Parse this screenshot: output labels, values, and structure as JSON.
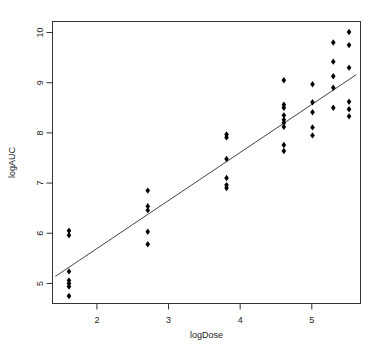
{
  "chart_data": {
    "type": "scatter",
    "title": "",
    "xlabel": "logDose",
    "ylabel": "logAUC",
    "xlim": [
      1.38,
      5.68
    ],
    "ylim": [
      4.6,
      10.22
    ],
    "xticks": [
      2,
      3,
      4,
      5
    ],
    "xtick_labels": [
      "2",
      "3",
      "4",
      "5"
    ],
    "yticks": [
      5,
      6,
      7,
      8,
      9,
      10
    ],
    "ytick_labels": [
      "5",
      "6",
      "7",
      "8",
      "9",
      "10"
    ],
    "grid": false,
    "legend": "none",
    "point_color": "#000000",
    "point_symbol": "filled-diamond",
    "line_color": "#444444",
    "frame": true,
    "points": [
      {
        "x": 1.61,
        "y": 6.05
      },
      {
        "x": 1.61,
        "y": 5.96
      },
      {
        "x": 1.61,
        "y": 5.24
      },
      {
        "x": 1.61,
        "y": 5.06
      },
      {
        "x": 1.61,
        "y": 5.0
      },
      {
        "x": 1.61,
        "y": 4.94
      },
      {
        "x": 1.61,
        "y": 4.75
      },
      {
        "x": 2.71,
        "y": 6.85
      },
      {
        "x": 2.71,
        "y": 6.54
      },
      {
        "x": 2.71,
        "y": 6.46
      },
      {
        "x": 2.71,
        "y": 6.03
      },
      {
        "x": 2.71,
        "y": 5.78
      },
      {
        "x": 3.81,
        "y": 7.97
      },
      {
        "x": 3.81,
        "y": 7.91
      },
      {
        "x": 3.81,
        "y": 7.48
      },
      {
        "x": 3.81,
        "y": 7.1
      },
      {
        "x": 3.81,
        "y": 6.96
      },
      {
        "x": 3.81,
        "y": 6.9
      },
      {
        "x": 4.61,
        "y": 9.05
      },
      {
        "x": 4.61,
        "y": 8.56
      },
      {
        "x": 4.61,
        "y": 8.5
      },
      {
        "x": 4.61,
        "y": 8.35
      },
      {
        "x": 4.61,
        "y": 8.26
      },
      {
        "x": 4.61,
        "y": 8.2
      },
      {
        "x": 4.61,
        "y": 8.12
      },
      {
        "x": 4.61,
        "y": 7.76
      },
      {
        "x": 4.61,
        "y": 7.64
      },
      {
        "x": 5.01,
        "y": 8.97
      },
      {
        "x": 5.01,
        "y": 8.61
      },
      {
        "x": 5.01,
        "y": 8.41
      },
      {
        "x": 5.01,
        "y": 8.11
      },
      {
        "x": 5.01,
        "y": 7.95
      },
      {
        "x": 5.3,
        "y": 9.8
      },
      {
        "x": 5.3,
        "y": 9.42
      },
      {
        "x": 5.3,
        "y": 9.13
      },
      {
        "x": 5.3,
        "y": 8.9
      },
      {
        "x": 5.3,
        "y": 8.5
      },
      {
        "x": 5.52,
        "y": 10.01
      },
      {
        "x": 5.52,
        "y": 9.75
      },
      {
        "x": 5.52,
        "y": 9.3
      },
      {
        "x": 5.52,
        "y": 8.62
      },
      {
        "x": 5.52,
        "y": 8.47
      },
      {
        "x": 5.52,
        "y": 8.33
      }
    ],
    "fit_line": {
      "x_start": 1.42,
      "y_start": 5.14,
      "x_end": 5.62,
      "y_end": 9.16
    }
  }
}
